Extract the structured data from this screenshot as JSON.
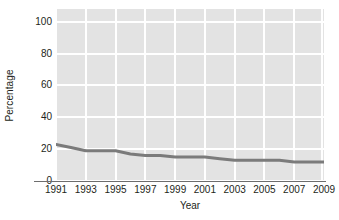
{
  "chart_data": {
    "type": "line",
    "title": "",
    "xlabel": "Year",
    "ylabel": "Percentage",
    "x": [
      1991,
      1992,
      1993,
      1994,
      1995,
      1996,
      1997,
      1998,
      1999,
      2000,
      2001,
      2002,
      2003,
      2004,
      2005,
      2006,
      2007,
      2008,
      2009
    ],
    "values": [
      23,
      21,
      19,
      19,
      19,
      17,
      16,
      16,
      15,
      15,
      15,
      14,
      13,
      13,
      13,
      13,
      12,
      12,
      12
    ],
    "series": [
      {
        "name": "Percentage",
        "values": [
          23,
          21,
          19,
          19,
          19,
          17,
          16,
          16,
          15,
          15,
          15,
          14,
          13,
          13,
          13,
          13,
          12,
          12,
          12
        ]
      }
    ],
    "xlim": [
      1991,
      2009
    ],
    "ylim": [
      0,
      108
    ],
    "xticks": [
      1991,
      1993,
      1995,
      1997,
      1999,
      2001,
      2003,
      2005,
      2007,
      2009
    ],
    "yticks": [
      0,
      20,
      40,
      60,
      80,
      100
    ],
    "xtick_labels": [
      "1991",
      "1993",
      "1995",
      "1997",
      "1999",
      "2001",
      "2003",
      "2005",
      "2007",
      "2009"
    ],
    "ytick_labels": [
      "0",
      "20",
      "40",
      "60",
      "80",
      "100"
    ],
    "grid": true,
    "grid_color": "#ffffff",
    "plot_background": "#e3e3e3",
    "line_color": "#7b7b7b",
    "line_width": 3,
    "legend": null,
    "legend_position": "none",
    "annotations": []
  },
  "axes": {
    "y_title": "Percentage",
    "x_title": "Year"
  }
}
